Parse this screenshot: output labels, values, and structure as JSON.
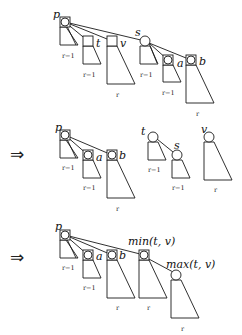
{
  "figure": {
    "type": "binomial-heap / rank-tree linking diagram",
    "stages": [
      {
        "id": "stage1",
        "nodes": [
          {
            "label": "p",
            "kind": "boxed-circle",
            "rank": "r−1"
          },
          {
            "label": "t",
            "kind": "box",
            "rank": "r−1"
          },
          {
            "label": "v",
            "kind": "box",
            "rank": "r"
          },
          {
            "label": "s",
            "kind": "circle",
            "rank": "r−1"
          },
          {
            "label": "a",
            "kind": "boxed-circle",
            "rank": "r−1"
          },
          {
            "label": "b",
            "kind": "boxed-circle",
            "rank": "r"
          }
        ]
      },
      {
        "id": "stage2",
        "arrow": "⇒",
        "nodes": [
          {
            "label": "p",
            "kind": "boxed-circle",
            "rank": "r−1"
          },
          {
            "label": "a",
            "kind": "boxed-circle",
            "rank": "r−1"
          },
          {
            "label": "b",
            "kind": "boxed-circle",
            "rank": "r"
          },
          {
            "label": "t",
            "kind": "circle",
            "rank": "r−1"
          },
          {
            "label": "s",
            "kind": "circle",
            "rank": "r−1"
          },
          {
            "label": "v",
            "kind": "circle",
            "rank": "r"
          }
        ]
      },
      {
        "id": "stage3",
        "arrow": "⇒",
        "nodes": [
          {
            "label": "p",
            "kind": "boxed-circle",
            "rank": "r−1"
          },
          {
            "label": "a",
            "kind": "boxed-circle",
            "rank": "r−1"
          },
          {
            "label": "b",
            "kind": "boxed-circle",
            "rank": "r"
          },
          {
            "label": "min(t,v)",
            "kind": "boxed-circle",
            "rank": "r"
          },
          {
            "label": "max(t,v)",
            "kind": "circle",
            "rank": "r"
          }
        ]
      }
    ]
  },
  "labels": {
    "p": "p",
    "t": "t",
    "v": "v",
    "s": "s",
    "a": "a",
    "b": "b",
    "min": "min(t, v)",
    "max": "max(t, v)",
    "r": "r",
    "rm1": "r−1",
    "arrow": "⇒"
  }
}
